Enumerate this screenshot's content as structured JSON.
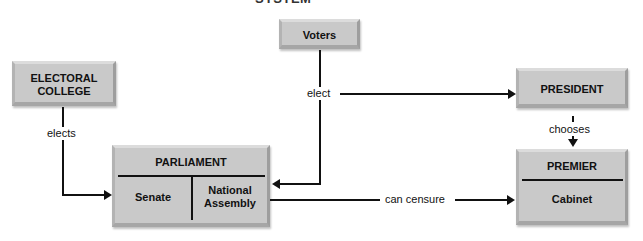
{
  "title": "SYSTEM",
  "nodes": {
    "electoral_college": "ELECTORAL\nCOLLEGE",
    "voters": "Voters",
    "president": "PRESIDENT",
    "parliament": "PARLIAMENT",
    "senate": "Senate",
    "national_assembly": "National\nAssembly",
    "premier": "PREMIER",
    "cabinet": "Cabinet"
  },
  "edges": {
    "elects": "elects",
    "elect": "elect",
    "chooses": "chooses",
    "can_censure": "can censure"
  }
}
